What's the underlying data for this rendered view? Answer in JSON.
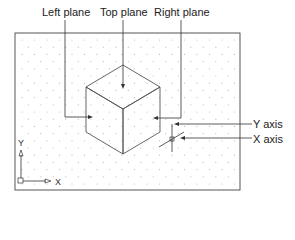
{
  "labels": {
    "left_plane": "Left plane",
    "top_plane": "Top plane",
    "right_plane": "Right plane",
    "y_axis": "Y axis",
    "x_axis": "X axis"
  },
  "ucs_icon": {
    "y_label": "Y",
    "x_label": "X"
  },
  "grid": {
    "visible": true,
    "style": "dots"
  },
  "colors": {
    "line": "#333333",
    "dot": "#bbbbbb",
    "background": "#ffffff"
  }
}
